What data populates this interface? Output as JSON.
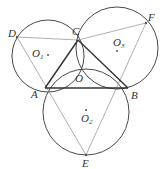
{
  "diagram": {
    "type": "geometry",
    "colors": {
      "circle": "#4a4a4a",
      "triangle": "#333333",
      "thin_line": "#9a9a9a",
      "point": "#555555",
      "label": "#333333"
    },
    "points": {
      "A": {
        "label": "A",
        "x": 45,
        "y": 88
      },
      "B": {
        "label": "B",
        "x": 128,
        "y": 88
      },
      "C": {
        "label": "C",
        "x": 78,
        "y": 40
      },
      "O": {
        "label": "O",
        "x": 80,
        "y": 66
      },
      "D": {
        "label": "D",
        "x": 17,
        "y": 37
      },
      "E": {
        "label": "E",
        "x": 86,
        "y": 155
      },
      "F": {
        "label": "F",
        "x": 146,
        "y": 23
      }
    },
    "centers": {
      "O1": {
        "label": "O",
        "sub": "1",
        "x": 48,
        "y": 55
      },
      "O2": {
        "label": "O",
        "sub": "2",
        "x": 86,
        "y": 110
      },
      "O3": {
        "label": "O",
        "sub": "3",
        "x": 117,
        "y": 51
      }
    },
    "circles": [
      {
        "name": "O1",
        "cx": 48,
        "cy": 56,
        "r": 36
      },
      {
        "name": "O2",
        "cx": 86,
        "cy": 112,
        "r": 43
      },
      {
        "name": "O3",
        "cx": 117,
        "cy": 48,
        "r": 41
      }
    ],
    "segments": {
      "triangle": [
        "AB",
        "BC",
        "CA"
      ],
      "thin": [
        "DC",
        "CF",
        "DA",
        "AE",
        "EB",
        "BF",
        "DE",
        "FE"
      ]
    }
  }
}
